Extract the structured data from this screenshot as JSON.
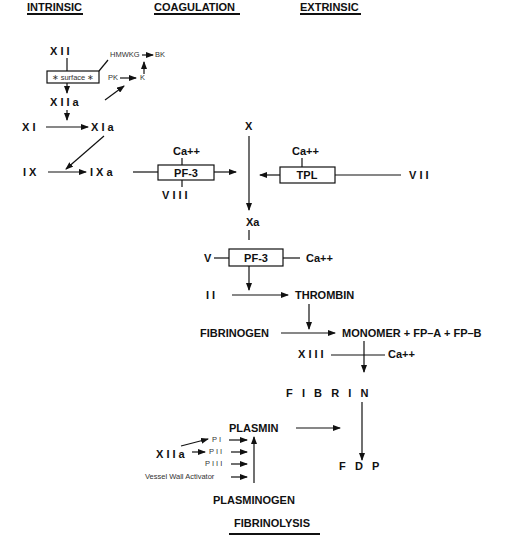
{
  "headers": {
    "intrinsic": "INTRINSIC",
    "coagulation": "COAGULATION",
    "extrinsic": "EXTRINSIC",
    "fibrinolysis": "FIBRINOLYSIS"
  },
  "intrinsic": {
    "xii": "X I I",
    "surface": "∗ surface ∗",
    "xiia": "X I I a",
    "hmwkg": "HMWKG",
    "bk": "BK",
    "pk": "PK",
    "k": "K",
    "xi": "X I",
    "xia": "X I a",
    "ix": "I X",
    "ixa": "I X a",
    "ca_1": "Ca++",
    "pf3_1": "PF-3",
    "viii": "V I I I"
  },
  "extrinsic": {
    "x": "X",
    "ca_2": "Ca++",
    "tpl": "TPL",
    "vii": "V I I"
  },
  "common": {
    "xa": "Xa",
    "v": "V",
    "pf3_2": "PF-3",
    "ca_3": "Ca++",
    "ii": "I I",
    "thrombin": "THROMBIN",
    "fibrinogen": "FIBRINOGEN",
    "monomer": "MONOMER + FP–A + FP–B",
    "xiii": "X I I I",
    "ca_4": "Ca++",
    "fibrin": "F   I   B   R   I   N"
  },
  "fibrinolysis": {
    "plasmin": "PLASMIN",
    "xiia": "X I I a",
    "pi": "P I",
    "pii": "P I I",
    "piii": "P I I I",
    "vessel": "Vessel Wall Activator",
    "plasminogen": "PLASMINOGEN",
    "fdp": "F   D   P"
  }
}
